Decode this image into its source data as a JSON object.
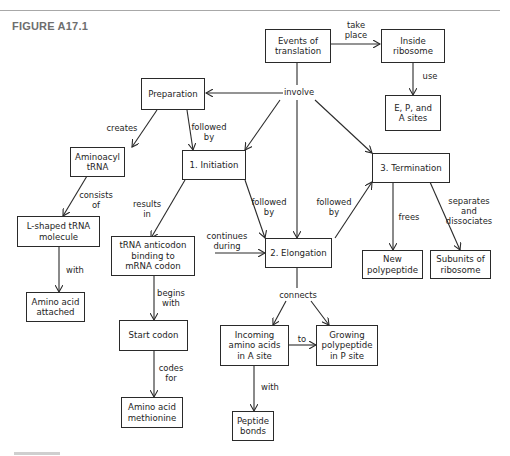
{
  "figure": {
    "title": "FIGURE A17.1"
  },
  "colors": {
    "line": "#2a2a2a",
    "title": "#6e6e6e",
    "rule": "#a8a8a8"
  },
  "nodes": {
    "events": "Events of\ntranslation",
    "inside_ribosome": "Inside\nribosome",
    "epa_sites": "E, P, and\nA sites",
    "preparation": "Preparation",
    "aminoacyl_trna": "Aminoacyl\ntRNA",
    "initiation": "1. Initiation",
    "termination": "3. Termination",
    "lshaped": "L-shaped tRNA\nmolecule",
    "anticodon": "tRNA anticodon\nbinding to\nmRNA codon",
    "elongation": "2. Elongation",
    "new_polypeptide": "New\npolypeptide",
    "subunits": "Subunits of\nribosome",
    "amino_attached": "Amino acid\nattached",
    "start_codon": "Start codon",
    "incoming": "Incoming\namino acids\nin A site",
    "growing": "Growing\npolypeptide\nin P site",
    "methionine": "Amino acid\nmethionine",
    "peptide_bonds": "Peptide\nbonds"
  },
  "links": {
    "take_place": "take\nplace",
    "use": "use",
    "involve": "involve",
    "creates": "creates",
    "followed_by_prep": "followed\nby",
    "consists_of": "consists\nof",
    "results_in": "results\nin",
    "followed_by_init": "followed\nby",
    "followed_by_elong": "followed\nby",
    "continues_during": "continues\nduring",
    "frees": "frees",
    "separates": "separates\nand\ndissociates",
    "with_amino": "with",
    "begins_with": "begins\nwith",
    "connects": "connects",
    "to": "to",
    "codes_for": "codes\nfor",
    "with_peptide": "with"
  }
}
